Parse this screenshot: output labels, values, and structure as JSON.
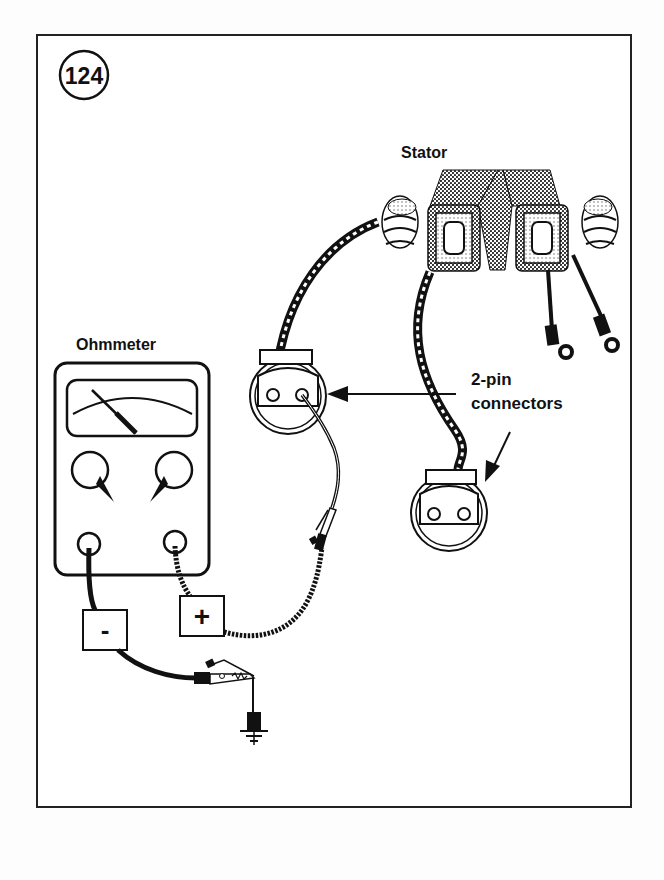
{
  "figure": {
    "number": "124",
    "labels": {
      "stator": "Stator",
      "ohmmeter": "Ohmmeter",
      "connectors_line1": "2-pin",
      "connectors_line2": "connectors",
      "negative": "-",
      "positive": "+"
    },
    "components": [
      "stator",
      "ohmmeter",
      "2-pin connector (left, under test)",
      "2-pin connector (right)",
      "negative test lead to ground",
      "positive test lead with alligator clip",
      "ground symbol"
    ],
    "colors": {
      "ink": "#111111",
      "background": "#ffffff",
      "hatch": "#555555"
    }
  }
}
